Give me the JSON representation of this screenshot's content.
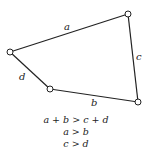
{
  "diagram": {
    "type": "four-bar linkage / quadrilateral",
    "nodes": [
      {
        "id": "top-right",
        "x": 128,
        "y": 14
      },
      {
        "id": "bottom-right",
        "x": 138,
        "y": 102
      },
      {
        "id": "bottom-left",
        "x": 50,
        "y": 89
      },
      {
        "id": "left",
        "x": 10,
        "y": 52
      }
    ],
    "edges": [
      {
        "label": "a",
        "from": "left",
        "to": "top-right"
      },
      {
        "label": "c",
        "from": "top-right",
        "to": "bottom-right"
      },
      {
        "label": "b",
        "from": "bottom-left",
        "to": "bottom-right"
      },
      {
        "label": "d",
        "from": "left",
        "to": "bottom-left"
      }
    ],
    "labels": {
      "a": "a",
      "b": "b",
      "c": "c",
      "d": "d"
    }
  },
  "conditions": [
    "a + b > c + d",
    "a > b",
    "c > d"
  ],
  "colors": {
    "line": "#222222",
    "node_fill": "#ffffff",
    "background": "#ffffff"
  }
}
